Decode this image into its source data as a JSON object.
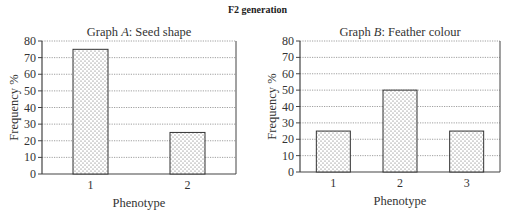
{
  "figure": {
    "suptitle": "F2 generation"
  },
  "chart_data": [
    {
      "type": "bar",
      "title": "Graph A: Seed shape",
      "title_prefix": "Graph ",
      "title_letter": "A",
      "title_suffix": ": Seed shape",
      "xlabel": "Phenotype",
      "ylabel": "Frequency %",
      "categories": [
        "1",
        "2"
      ],
      "values": [
        75,
        25
      ],
      "ylim": [
        0,
        80
      ],
      "yticks": [
        0,
        10,
        20,
        30,
        40,
        50,
        60,
        70,
        80
      ],
      "grid": true,
      "legend": null
    },
    {
      "type": "bar",
      "title": "Graph B: Feather colour",
      "title_prefix": "Graph ",
      "title_letter": "B",
      "title_suffix": ": Feather colour",
      "xlabel": "Phenotype",
      "ylabel": "Frequency %",
      "categories": [
        "1",
        "2",
        "3"
      ],
      "values": [
        25,
        50,
        25
      ],
      "ylim": [
        0,
        80
      ],
      "yticks": [
        0,
        10,
        20,
        30,
        40,
        50,
        60,
        70,
        80
      ],
      "grid": true,
      "legend": null
    }
  ],
  "style": {
    "bar_fill": "#ffffff",
    "bar_dot": "#555555",
    "bar_stroke": "#333333",
    "grid_color": "#888888",
    "axis_color": "#444444"
  }
}
